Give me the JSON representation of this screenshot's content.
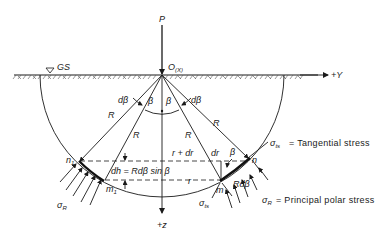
{
  "figure": {
    "type": "engineering-diagram",
    "labels": {
      "load": "P",
      "origin": "O",
      "origin_axis": "(X)",
      "ground_surface": "GS",
      "y_axis": "+Y",
      "z_axis": "+z",
      "radius": "R",
      "angle": "β",
      "d_angle": "dβ",
      "r_plus_dr": "r + dr",
      "r": "r",
      "dr": "dr",
      "dh_formula": "dh = Rdβ sin β",
      "rd_beta": "Rdβ",
      "point_n1": "n",
      "point_n1_sub": "1",
      "point_m1": "m",
      "point_m1_sub": "1",
      "point_n": "n",
      "point_m": "m",
      "sigma_R": "σ",
      "sigma_R_sub": "R",
      "sigma_ts": "σ",
      "sigma_ts_sub": "ts"
    },
    "legend": [
      {
        "symbol": "σ",
        "sub": "ts",
        "text": "= Tangential stress"
      },
      {
        "symbol": "σ",
        "sub": "R",
        "text": "= Principal polar stress"
      }
    ],
    "colors": {
      "ink": "#1a1a1a",
      "background": "#ffffff"
    }
  }
}
